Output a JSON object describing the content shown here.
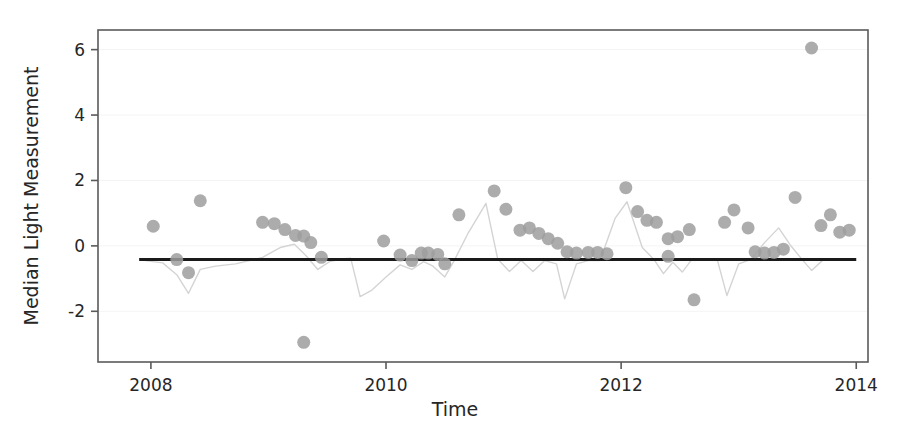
{
  "chart_data": {
    "type": "scatter",
    "title": "",
    "xlabel": "Time",
    "ylabel": "Median Light Measurement",
    "xlim": [
      2007.55,
      2014.1
    ],
    "ylim": [
      -3.55,
      6.6
    ],
    "xticks": [
      2008,
      2010,
      2012,
      2014
    ],
    "xticklabels": [
      "2008",
      "2010",
      "2012",
      "2014"
    ],
    "yticks": [
      -2,
      0,
      2,
      4,
      6
    ],
    "yticklabels": [
      "-2",
      "0",
      "2",
      "4",
      "6"
    ],
    "grid": false,
    "legend": null,
    "point_color": "#9e9e9e",
    "point_radius": 6.5,
    "reference_line": {
      "name": "baseline",
      "y": -0.42,
      "color": "#1a1a1a",
      "width": 3,
      "x_start": 2007.9,
      "x_end": 2014.0
    },
    "series": [
      {
        "name": "Median Light Measurement",
        "type": "scatter",
        "color": "#9e9e9e",
        "points": [
          [
            2008.02,
            0.6
          ],
          [
            2008.22,
            -0.42
          ],
          [
            2008.32,
            -0.82
          ],
          [
            2008.42,
            1.38
          ],
          [
            2008.95,
            0.72
          ],
          [
            2009.05,
            0.68
          ],
          [
            2009.14,
            0.5
          ],
          [
            2009.23,
            0.32
          ],
          [
            2009.3,
            0.3
          ],
          [
            2009.36,
            0.1
          ],
          [
            2009.45,
            -0.35
          ],
          [
            2009.3,
            -2.95
          ],
          [
            2009.98,
            0.15
          ],
          [
            2010.12,
            -0.28
          ],
          [
            2010.22,
            -0.45
          ],
          [
            2010.3,
            -0.22
          ],
          [
            2010.36,
            -0.22
          ],
          [
            2010.44,
            -0.26
          ],
          [
            2010.5,
            -0.55
          ],
          [
            2010.62,
            0.95
          ],
          [
            2010.92,
            1.68
          ],
          [
            2011.02,
            1.12
          ],
          [
            2011.14,
            0.48
          ],
          [
            2011.22,
            0.55
          ],
          [
            2011.3,
            0.38
          ],
          [
            2011.38,
            0.22
          ],
          [
            2011.46,
            0.08
          ],
          [
            2011.54,
            -0.18
          ],
          [
            2011.62,
            -0.22
          ],
          [
            2011.72,
            -0.2
          ],
          [
            2011.8,
            -0.2
          ],
          [
            2011.88,
            -0.24
          ],
          [
            2012.04,
            1.78
          ],
          [
            2012.14,
            1.05
          ],
          [
            2012.22,
            0.78
          ],
          [
            2012.3,
            0.72
          ],
          [
            2012.4,
            0.22
          ],
          [
            2012.48,
            0.28
          ],
          [
            2012.58,
            0.5
          ],
          [
            2012.4,
            -0.32
          ],
          [
            2012.62,
            -1.65
          ],
          [
            2012.88,
            0.72
          ],
          [
            2012.96,
            1.1
          ],
          [
            2013.08,
            0.55
          ],
          [
            2013.14,
            -0.18
          ],
          [
            2013.22,
            -0.22
          ],
          [
            2013.3,
            -0.2
          ],
          [
            2013.38,
            -0.1
          ],
          [
            2013.48,
            1.48
          ],
          [
            2013.62,
            6.05
          ],
          [
            2013.7,
            0.62
          ],
          [
            2013.78,
            0.95
          ],
          [
            2013.86,
            0.42
          ],
          [
            2013.94,
            0.48
          ]
        ]
      },
      {
        "name": "model-fit-line",
        "type": "line",
        "color": "#d4d4d4",
        "width": 1.4,
        "points": [
          [
            2007.95,
            -0.45
          ],
          [
            2008.1,
            -0.52
          ],
          [
            2008.22,
            -0.88
          ],
          [
            2008.32,
            -1.45
          ],
          [
            2008.42,
            -0.72
          ],
          [
            2008.55,
            -0.62
          ],
          [
            2008.72,
            -0.55
          ],
          [
            2008.95,
            -0.35
          ],
          [
            2009.1,
            -0.05
          ],
          [
            2009.22,
            0.05
          ],
          [
            2009.32,
            -0.3
          ],
          [
            2009.42,
            -0.72
          ],
          [
            2009.52,
            -0.48
          ],
          [
            2009.62,
            -0.4
          ],
          [
            2009.7,
            -0.38
          ],
          [
            2009.78,
            -1.55
          ],
          [
            2009.88,
            -1.35
          ],
          [
            2010.0,
            -0.95
          ],
          [
            2010.12,
            -0.58
          ],
          [
            2010.22,
            -0.72
          ],
          [
            2010.32,
            -0.48
          ],
          [
            2010.4,
            -0.62
          ],
          [
            2010.5,
            -0.95
          ],
          [
            2010.58,
            -0.45
          ],
          [
            2010.7,
            0.4
          ],
          [
            2010.85,
            1.3
          ],
          [
            2010.95,
            -0.4
          ],
          [
            2011.05,
            -0.78
          ],
          [
            2011.15,
            -0.45
          ],
          [
            2011.25,
            -0.78
          ],
          [
            2011.35,
            -0.45
          ],
          [
            2011.45,
            -0.55
          ],
          [
            2011.52,
            -1.62
          ],
          [
            2011.62,
            -0.55
          ],
          [
            2011.72,
            -0.45
          ],
          [
            2011.82,
            -0.45
          ],
          [
            2011.95,
            0.85
          ],
          [
            2012.05,
            1.35
          ],
          [
            2012.18,
            -0.05
          ],
          [
            2012.28,
            -0.42
          ],
          [
            2012.36,
            -0.85
          ],
          [
            2012.44,
            -0.5
          ],
          [
            2012.52,
            -0.8
          ],
          [
            2012.6,
            -0.42
          ],
          [
            2012.72,
            -0.42
          ],
          [
            2012.82,
            -0.45
          ],
          [
            2012.9,
            -1.52
          ],
          [
            2013.0,
            -0.55
          ],
          [
            2013.1,
            -0.42
          ],
          [
            2013.22,
            0.1
          ],
          [
            2013.34,
            0.55
          ],
          [
            2013.44,
            0.02
          ],
          [
            2013.54,
            -0.42
          ],
          [
            2013.62,
            -0.75
          ],
          [
            2013.72,
            -0.42
          ],
          [
            2013.84,
            -0.42
          ],
          [
            2013.96,
            -0.42
          ]
        ]
      }
    ]
  },
  "axis": {
    "xlabel": "Time",
    "ylabel": "Median Light Measurement"
  }
}
